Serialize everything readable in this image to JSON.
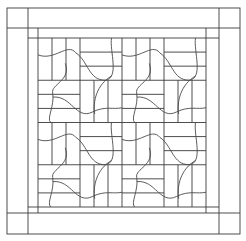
{
  "colors": {
    "background": "#ffffff",
    "line": "#3a3a3a"
  },
  "layout": {
    "outer": {
      "x": 7,
      "y": 8,
      "w": 233,
      "h": 226
    },
    "border_inner": {
      "x": 28,
      "y": 28,
      "w": 191,
      "h": 185
    },
    "sashing": {
      "x": 38,
      "y": 38,
      "w": 168,
      "h": 169
    },
    "grid": {
      "rows": 4,
      "cols": 4,
      "strips_per_block": 3
    }
  }
}
